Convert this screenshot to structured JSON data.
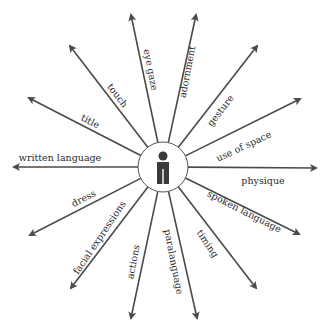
{
  "diagram": {
    "center": {
      "x": 163,
      "y": 167,
      "r": 25,
      "icon": "person-icon"
    },
    "colors": {
      "line": "#4a4a4a",
      "icon": "#3a3a3a",
      "text": "#2b2b2b",
      "circle": "#555555"
    },
    "spokes": [
      {
        "id": "written-language",
        "label": "written language",
        "tip": [
          14,
          167
        ],
        "lx": 60,
        "ly": 158,
        "rot": 0
      },
      {
        "id": "title",
        "label": "title",
        "tip": [
          29,
          98
        ],
        "lx": 90,
        "ly": 122,
        "rot": 27
      },
      {
        "id": "touch",
        "label": "touch",
        "tip": [
          70,
          46
        ],
        "lx": 117,
        "ly": 96,
        "rot": 52
      },
      {
        "id": "eye-gaze",
        "label": "eye gaze",
        "tip": [
          131,
          15
        ],
        "lx": 150,
        "ly": 70,
        "rot": 79
      },
      {
        "id": "adornment",
        "label": "adornment",
        "tip": [
          196,
          15
        ],
        "lx": 188,
        "ly": 72,
        "rot": -79
      },
      {
        "id": "gesture",
        "label": "gesture",
        "tip": [
          257,
          46
        ],
        "lx": 221,
        "ly": 111,
        "rot": -52
      },
      {
        "id": "use-of-space",
        "label": "use of space",
        "tip": [
          300,
          99
        ],
        "lx": 244,
        "ly": 147,
        "rot": -25
      },
      {
        "id": "physique",
        "label": "physique",
        "tip": [
          316,
          168
        ],
        "lx": 263,
        "ly": 181,
        "rot": 0
      },
      {
        "id": "spoken-language",
        "label": "spoken language",
        "tip": [
          299,
          234
        ],
        "lx": 244,
        "ly": 212,
        "rot": 27
      },
      {
        "id": "timing",
        "label": "timing",
        "tip": [
          256,
          288
        ],
        "lx": 207,
        "ly": 244,
        "rot": 56
      },
      {
        "id": "paralanguage",
        "label": "paralanguage",
        "tip": [
          197,
          318
        ],
        "lx": 173,
        "ly": 262,
        "rot": 79
      },
      {
        "id": "actions",
        "label": "actions",
        "tip": [
          131,
          318
        ],
        "lx": 134,
        "ly": 262,
        "rot": -79
      },
      {
        "id": "facial-expressions",
        "label": "facial expressions",
        "tip": [
          71,
          288
        ],
        "lx": 100,
        "ly": 238,
        "rot": -56
      },
      {
        "id": "dress",
        "label": "dress",
        "tip": [
          30,
          235
        ],
        "lx": 84,
        "ly": 199,
        "rot": -27
      }
    ]
  }
}
